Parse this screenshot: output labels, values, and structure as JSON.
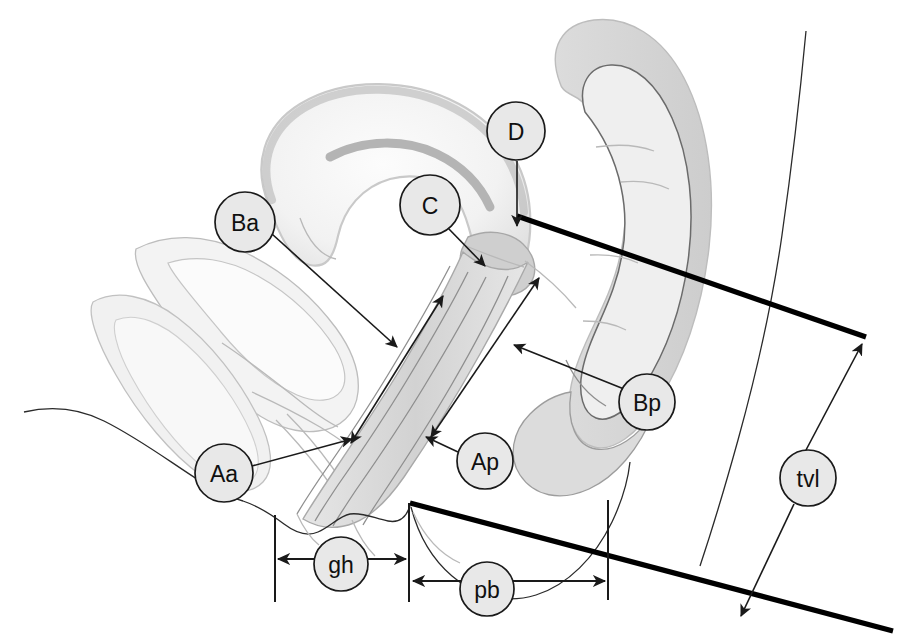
{
  "figure": {
    "kind": "anatomical-line-drawing",
    "background_color": "#ffffff",
    "ink_color": "#1a1a1a",
    "label_fill_color": "#e8e8e8",
    "tissue_fill_light": "#f4f4f4",
    "tissue_fill_mid": "#e2e2e2",
    "tissue_fill_dark": "#cfcfcf"
  },
  "labels": [
    {
      "id": "Ba",
      "text": "Ba",
      "cx": 245,
      "cy": 222,
      "r": 30
    },
    {
      "id": "C",
      "text": "C",
      "cx": 430,
      "cy": 205,
      "r": 30
    },
    {
      "id": "D",
      "text": "D",
      "cx": 516,
      "cy": 131,
      "r": 29
    },
    {
      "id": "Bp",
      "text": "Bp",
      "cx": 647,
      "cy": 402,
      "r": 28
    },
    {
      "id": "Aa",
      "text": "Aa",
      "cx": 224,
      "cy": 473,
      "r": 29
    },
    {
      "id": "Ap",
      "text": "Ap",
      "cx": 485,
      "cy": 461,
      "r": 28
    },
    {
      "id": "tvl",
      "text": "tvl",
      "cx": 808,
      "cy": 478,
      "r": 28
    },
    {
      "id": "gh",
      "text": "gh",
      "cx": 341,
      "cy": 564,
      "r": 27
    },
    {
      "id": "pb",
      "text": "pb",
      "cx": 487,
      "cy": 589,
      "r": 27
    }
  ],
  "measurements": [
    {
      "id": "gh",
      "name": "genital hiatus",
      "x_start": 275,
      "x_end": 409,
      "y": 559
    },
    {
      "id": "pb",
      "name": "perineal body",
      "x_start": 410,
      "x_end": 608,
      "y": 580
    },
    {
      "id": "tvl",
      "name": "total vaginal length",
      "from_x": 864,
      "from_y": 338,
      "to_x": 740,
      "to_y": 617
    }
  ],
  "reference_lines": [
    {
      "id": "hymen-plane-upper",
      "x1": 517,
      "y1": 216,
      "x2": 866,
      "y2": 337
    },
    {
      "id": "hymen-plane-lower",
      "x1": 410,
      "y1": 503,
      "x2": 890,
      "y2": 630
    }
  ],
  "landmark_arrows": [
    {
      "id": "Ba-arrow",
      "from": "Ba label",
      "to": "anterior vaginal wall point Ba"
    },
    {
      "id": "C-arrow",
      "from": "C label",
      "to": "cervix"
    },
    {
      "id": "D-arrow",
      "from": "D label",
      "to": "posterior fornix"
    },
    {
      "id": "Bp-arrow",
      "from": "Bp label",
      "to": "posterior vaginal wall point Bp"
    },
    {
      "id": "Aa-arrow",
      "from": "Aa label",
      "to": "anterior vaginal wall point Aa"
    },
    {
      "id": "Ap-arrow",
      "from": "Ap label",
      "to": "posterior vaginal wall point Ap"
    }
  ]
}
